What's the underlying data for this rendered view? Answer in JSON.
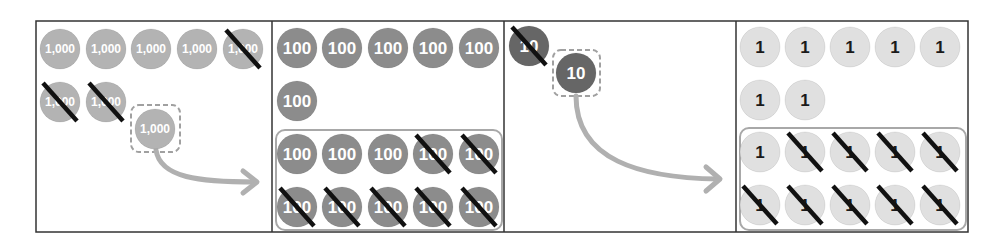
{
  "diagram": {
    "colors": {
      "frame": "#333333",
      "thousand_disk": "#b3b3b3",
      "thousand_text": "#ffffff",
      "hundred_disk": "#8c8c8c",
      "hundred_text": "#ffffff",
      "ten_disk": "#666666",
      "ten_text": "#ffffff",
      "one_disk": "#e0e0e0",
      "one_text": "#1a1a1a",
      "cross": "#111111",
      "arrow": "#b0b0b0",
      "dashed_box": "#a0a0a0",
      "group_box": "#a8a8a8"
    },
    "panels": [
      {
        "name": "thousands",
        "disk_label": "1,000",
        "rows": [
          [
            {
              "label": "1,000",
              "crossed": false
            },
            {
              "label": "1,000",
              "crossed": false
            },
            {
              "label": "1,000",
              "crossed": false
            },
            {
              "label": "1,000",
              "crossed": false
            },
            {
              "label": "1,000",
              "crossed": true
            }
          ],
          [
            {
              "label": "1,000",
              "crossed": true
            },
            {
              "label": "1,000",
              "crossed": true
            }
          ]
        ],
        "regrouped_disk": {
          "label": "1,000",
          "dashed": true
        },
        "arrow": "to-hundreds"
      },
      {
        "name": "hundreds",
        "disk_label": "100",
        "rows": [
          [
            {
              "label": "100",
              "crossed": false
            },
            {
              "label": "100",
              "crossed": false
            },
            {
              "label": "100",
              "crossed": false
            },
            {
              "label": "100",
              "crossed": false
            },
            {
              "label": "100",
              "crossed": false
            }
          ],
          [
            {
              "label": "100",
              "crossed": false
            }
          ]
        ],
        "group": [
          [
            {
              "label": "100",
              "crossed": false
            },
            {
              "label": "100",
              "crossed": false
            },
            {
              "label": "100",
              "crossed": false
            },
            {
              "label": "100",
              "crossed": true
            },
            {
              "label": "100",
              "crossed": true
            }
          ],
          [
            {
              "label": "100",
              "crossed": true
            },
            {
              "label": "100",
              "crossed": true
            },
            {
              "label": "100",
              "crossed": true
            },
            {
              "label": "100",
              "crossed": true
            },
            {
              "label": "100",
              "crossed": true
            }
          ]
        ]
      },
      {
        "name": "tens",
        "disk_label": "10",
        "rows": [
          [
            {
              "label": "10",
              "crossed": true
            }
          ]
        ],
        "regrouped_disk": {
          "label": "10",
          "dashed": true
        },
        "arrow": "to-ones"
      },
      {
        "name": "ones",
        "disk_label": "1",
        "rows": [
          [
            {
              "label": "1",
              "crossed": false
            },
            {
              "label": "1",
              "crossed": false
            },
            {
              "label": "1",
              "crossed": false
            },
            {
              "label": "1",
              "crossed": false
            },
            {
              "label": "1",
              "crossed": false
            }
          ],
          [
            {
              "label": "1",
              "crossed": false
            },
            {
              "label": "1",
              "crossed": false
            }
          ]
        ],
        "group": [
          [
            {
              "label": "1",
              "crossed": false
            },
            {
              "label": "1",
              "crossed": true
            },
            {
              "label": "1",
              "crossed": true
            },
            {
              "label": "1",
              "crossed": true
            },
            {
              "label": "1",
              "crossed": true
            }
          ],
          [
            {
              "label": "1",
              "crossed": true
            },
            {
              "label": "1",
              "crossed": true
            },
            {
              "label": "1",
              "crossed": true
            },
            {
              "label": "1",
              "crossed": true
            },
            {
              "label": "1",
              "crossed": true
            }
          ]
        ]
      }
    ]
  }
}
